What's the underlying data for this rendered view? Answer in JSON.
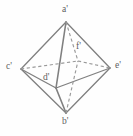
{
  "figure": {
    "name": "octahedron-line-diagram",
    "background_color": "#fefefe",
    "stroke_color": "#808080",
    "hidden_stroke_color": "#9a9a9a",
    "label_color": "#5f5f5f",
    "width": 133,
    "height": 136
  },
  "labels": {
    "a": "a'",
    "b": "b'",
    "c": "c'",
    "d": "d'",
    "e": "e'",
    "f": "f'"
  },
  "vertices": [
    {
      "id": "a",
      "label": "a'",
      "x": 66,
      "y": 22,
      "role": "top-apex",
      "label_x": 62,
      "label_y": 7
    },
    {
      "id": "b",
      "label": "b'",
      "x": 66,
      "y": 113,
      "role": "bottom-apex",
      "label_x": 62,
      "label_y": 118
    },
    {
      "id": "c",
      "label": "c'",
      "x": 21,
      "y": 69,
      "role": "left-equator",
      "label_x": 7,
      "label_y": 63
    },
    {
      "id": "d",
      "label": "d'",
      "x": 56,
      "y": 88,
      "role": "front-equator",
      "label_x": 45,
      "label_y": 74
    },
    {
      "id": "e",
      "label": "e'",
      "x": 110,
      "y": 68,
      "role": "right-equator",
      "label_x": 114,
      "label_y": 62
    },
    {
      "id": "f",
      "label": "f'",
      "x": 78,
      "y": 61,
      "role": "back-equator-hidden",
      "label_x": 78,
      "label_y": 44
    }
  ],
  "edges": [
    {
      "from": "a",
      "to": "c",
      "style": "solid"
    },
    {
      "from": "a",
      "to": "e",
      "style": "solid"
    },
    {
      "from": "a",
      "to": "d",
      "style": "solid"
    },
    {
      "from": "a",
      "to": "f",
      "style": "dashed"
    },
    {
      "from": "b",
      "to": "c",
      "style": "solid"
    },
    {
      "from": "b",
      "to": "e",
      "style": "solid"
    },
    {
      "from": "b",
      "to": "d",
      "style": "solid"
    },
    {
      "from": "b",
      "to": "f",
      "style": "dashed"
    },
    {
      "from": "c",
      "to": "d",
      "style": "solid"
    },
    {
      "from": "d",
      "to": "e",
      "style": "solid"
    },
    {
      "from": "c",
      "to": "f",
      "style": "dashed"
    },
    {
      "from": "f",
      "to": "e",
      "style": "dashed"
    }
  ]
}
